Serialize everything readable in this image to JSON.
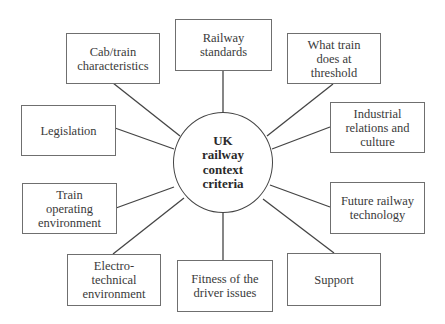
{
  "diagram": {
    "type": "hub-and-spoke concept map",
    "center": {
      "lines": [
        "UK",
        "railway",
        "context",
        "criteria"
      ]
    },
    "nodes": [
      {
        "id": "cab-train",
        "lines": [
          "Cab/train",
          "characteristics"
        ]
      },
      {
        "id": "railway-standards",
        "lines": [
          "Railway",
          "standards"
        ]
      },
      {
        "id": "what-train-does",
        "lines": [
          "What train",
          "does at",
          "threshold"
        ]
      },
      {
        "id": "legislation",
        "lines": [
          "Legislation"
        ]
      },
      {
        "id": "industrial-relations",
        "lines": [
          "Industrial",
          "relations and",
          "culture"
        ]
      },
      {
        "id": "train-operating",
        "lines": [
          "Train",
          "operating",
          "environment"
        ]
      },
      {
        "id": "future-railway",
        "lines": [
          "Future railway",
          "technology"
        ]
      },
      {
        "id": "electro-technical",
        "lines": [
          "Electro-technical",
          "environment"
        ]
      },
      {
        "id": "fitness-driver",
        "lines": [
          "Fitness of the",
          "driver issues"
        ]
      },
      {
        "id": "support",
        "lines": [
          "Support"
        ]
      }
    ],
    "colors": {
      "line": "#444444",
      "box_border": "#6f6f6f",
      "text": "#3a3a3a",
      "background": "#ffffff"
    }
  }
}
